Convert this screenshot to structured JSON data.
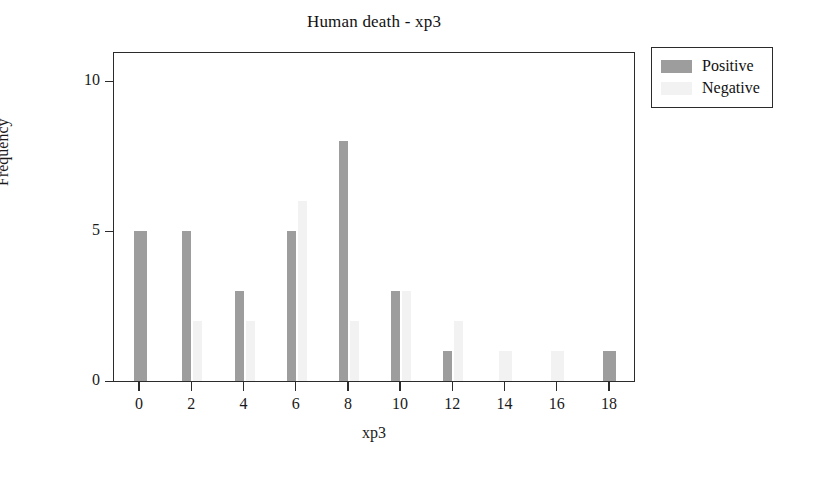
{
  "chart_data": {
    "type": "bar",
    "title": "Human death - xp3",
    "xlabel": "xp3",
    "ylabel": "Frequency",
    "categories": [
      "0",
      "2",
      "4",
      "6",
      "8",
      "10",
      "12",
      "14",
      "16",
      "18"
    ],
    "xlim": [
      -1,
      19
    ],
    "ylim": [
      0,
      11
    ],
    "xticks": [
      "0",
      "2",
      "4",
      "6",
      "8",
      "10",
      "12",
      "14",
      "16",
      "18"
    ],
    "yticks": [
      "0",
      "5",
      "10"
    ],
    "grid": false,
    "legend_position": "outside-top-right",
    "series": [
      {
        "name": "Positive",
        "color": "#9d9d9d",
        "values": [
          5,
          5,
          3,
          5,
          8,
          3,
          1,
          0,
          0,
          1
        ]
      },
      {
        "name": "Negative",
        "color": "#f2f2f2",
        "values": [
          0,
          2,
          2,
          6,
          2,
          3,
          2,
          1,
          1,
          0
        ]
      }
    ]
  },
  "legend": {
    "entries": [
      {
        "label": "Positive",
        "swatch": "positive-swatch"
      },
      {
        "label": "Negative",
        "swatch": "negative-swatch"
      }
    ]
  }
}
